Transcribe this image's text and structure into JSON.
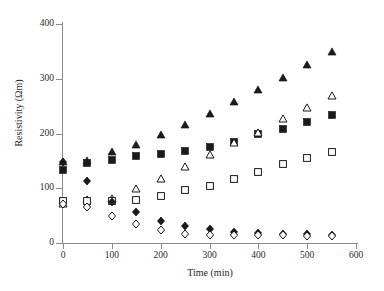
{
  "chart_data": {
    "type": "scatter",
    "title": "",
    "xlabel": "Time (min)",
    "ylabel": "Resistivity (Ωm)",
    "xlim": [
      0,
      600
    ],
    "ylim": [
      0,
      400
    ],
    "xticks": [
      0,
      100,
      200,
      300,
      400,
      500,
      600
    ],
    "yticks": [
      0,
      100,
      200,
      300,
      400
    ],
    "grid": false,
    "legend": "none",
    "x": [
      0,
      50,
      100,
      150,
      200,
      250,
      300,
      350,
      400,
      450,
      500,
      550
    ],
    "series": [
      {
        "name": "filled-triangle",
        "marker": "filled-triangle",
        "color": "#1a1a1a",
        "values": [
          148,
          150,
          166,
          179,
          197,
          215,
          235,
          257,
          279,
          301,
          325,
          348
        ]
      },
      {
        "name": "filled-square",
        "marker": "filled-square",
        "color": "#1a1a1a",
        "values": [
          133,
          147,
          152,
          158,
          162,
          168,
          175,
          185,
          199,
          209,
          221,
          234
        ]
      },
      {
        "name": "open-triangle",
        "marker": "open-triangle",
        "color": "#1a1a1a",
        "values": [
          72,
          79,
          80,
          98,
          117,
          139,
          160,
          182,
          201,
          227,
          247,
          269
        ]
      },
      {
        "name": "open-square",
        "marker": "open-square",
        "color": "#1a1a1a",
        "values": [
          77,
          77,
          77,
          79,
          86,
          96,
          104,
          116,
          129,
          144,
          156,
          166
        ]
      },
      {
        "name": "filled-diamond",
        "marker": "filled-diamond",
        "color": "#1a1a1a",
        "values": [
          148,
          114,
          74,
          56,
          41,
          31,
          25,
          21,
          19,
          17,
          16,
          15
        ]
      },
      {
        "name": "open-diamond",
        "marker": "open-diamond",
        "color": "#1a1a1a",
        "values": [
          72,
          66,
          49,
          34,
          23,
          17,
          15,
          15,
          14,
          14,
          13,
          13
        ]
      }
    ]
  },
  "axes": {
    "y_tick_labels": [
      "0",
      "100",
      "200",
      "300",
      "400"
    ],
    "x_tick_labels": [
      "0",
      "100",
      "200",
      "300",
      "400",
      "500",
      "600"
    ],
    "y_title": "Resistivity (Ωm)",
    "x_title": "Time (min)"
  }
}
